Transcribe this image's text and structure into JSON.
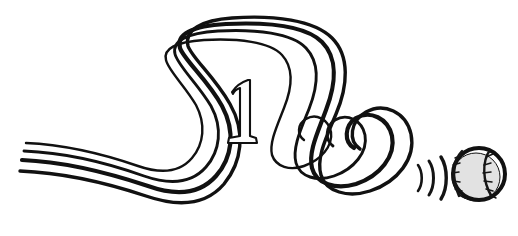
{
  "artwork": {
    "title": "Pitch Trajectory with Baseball",
    "caption": "",
    "medium": "black ink line drawing",
    "background_color": "#ffffff",
    "ink_color": "#111111",
    "canvas": {
      "width": 518,
      "height": 236
    }
  },
  "numeral": {
    "value": "1",
    "style": "serif outline",
    "center_x": 241,
    "center_y": 114,
    "fill_color": "#fdfdfd",
    "outline_color": "#101010"
  },
  "trail": {
    "label": "pitch-trajectory-trail",
    "stroke_color": "#111111",
    "line_count": 4,
    "description": "four parallel tapering strokes sweeping from lower left, over a tall arch, down into a coiled spiral, then out to the right",
    "strokes": [
      {
        "name": "trail-line-outer",
        "width": 4.2,
        "path": "M 22 160 C 72 162 118 176 148 186 C 176 196 200 194 216 176 C 232 158 236 132 222 106 C 208 80 184 60 180 48 C 176 34 192 26 226 24 C 268 22 306 26 322 42 C 338 58 336 84 326 110 C 318 132 308 152 312 168 C 316 184 336 190 356 184 C 380 176 396 156 392 136 C 388 118 370 110 356 118 C 344 126 344 142 354 148"
      },
      {
        "name": "trail-line-second",
        "width": 3.4,
        "path": "M 20 171 C 70 173 116 186 146 196 C 178 207 206 205 224 184 C 242 162 246 132 230 104 C 214 76 192 58 188 46 C 184 30 202 20 232 18 C 274 15 314 20 332 38 C 350 56 348 86 336 114 C 326 138 316 158 321 175 C 326 192 348 198 370 191 C 398 182 416 158 411 134 C 406 112 384 102 366 112 C 350 121 348 141 360 149"
      },
      {
        "name": "trail-line-third",
        "width": 2.9,
        "path": "M 24 151 C 74 153 116 166 144 176 C 170 185 192 183 206 167 C 220 151 223 128 211 106 C 198 84 178 66 175 54 C 172 41 186 33 218 31 C 256 29 292 33 306 48 C 320 63 318 86 309 109 C 301 129 292 148 296 163 C 300 177 317 182 334 176 C 354 169 368 152 365 135 C 362 120 347 113 335 120 C 325 127 325 140 333 146"
      },
      {
        "name": "trail-line-inner",
        "width": 2.4,
        "path": "M 26 143 C 72 145 112 157 138 166 C 161 174 180 172 192 158 C 204 144 206 124 196 105 C 185 86 168 70 166 60 C 163 49 175 42 204 40 C 238 38 270 42 282 55 C 294 68 292 88 284 108 C 277 126 269 143 272 155 C 276 167 290 171 304 166 C 321 160 333 146 331 132 C 328 119 316 113 306 119 C 297 124 297 135 304 140"
      }
    ]
  },
  "motion_arcs": {
    "label": "speed-lines",
    "count": 3,
    "stroke_color": "#141414",
    "arcs": [
      {
        "name": "motion-arc-1",
        "width": 2.6,
        "path": "M 418 165 C 423 172 423 184 418 191"
      },
      {
        "name": "motion-arc-2",
        "width": 3.0,
        "path": "M 429 161 C 435 170 435 186 429 195"
      },
      {
        "name": "motion-arc-3",
        "width": 3.4,
        "path": "M 441 157 C 448 168 448 188 441 199"
      }
    ]
  },
  "baseball": {
    "label": "baseball",
    "center_x": 479,
    "center_y": 174,
    "radius": 26,
    "outline_color": "#111111",
    "outline_width": 4,
    "fill_color": "#fbfbfb",
    "shadow_color": "#e2e2e2",
    "seam_color": "#151515",
    "seam_count": 2,
    "stitch_count": 12,
    "seams": [
      {
        "name": "ball-seam-left",
        "path": "M 462 151 C 453 160 451 178 459 196"
      },
      {
        "name": "ball-seam-right",
        "path": "M 490 150 C 482 161 482 181 492 197"
      }
    ],
    "stitches": [
      {
        "name": "ball-stitch",
        "path": "M 455 158 l 7 -3"
      },
      {
        "name": "ball-stitch",
        "path": "M 453 165 l 7 -2"
      },
      {
        "name": "ball-stitch",
        "path": "M 452 173 l 7 -1"
      },
      {
        "name": "ball-stitch",
        "path": "M 453 181 l 7 1"
      },
      {
        "name": "ball-stitch",
        "path": "M 455 189 l 7 2"
      },
      {
        "name": "ball-stitch",
        "path": "M 459 195 l 6 3"
      },
      {
        "name": "ball-stitch",
        "path": "M 486 157 l 7 -3"
      },
      {
        "name": "ball-stitch",
        "path": "M 484 165 l 7 -2"
      },
      {
        "name": "ball-stitch",
        "path": "M 483 173 l 8 -1"
      },
      {
        "name": "ball-stitch",
        "path": "M 484 181 l 8 1"
      },
      {
        "name": "ball-stitch",
        "path": "M 486 189 l 7 2"
      },
      {
        "name": "ball-stitch",
        "path": "M 490 195 l 6 3"
      }
    ]
  }
}
